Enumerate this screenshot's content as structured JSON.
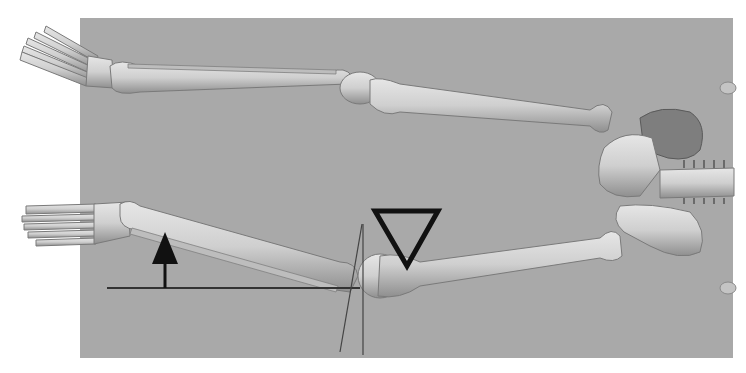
{
  "figure": {
    "background_color": "#a9a9a9",
    "bone_color": "#d2d2d2",
    "annotation_color": "#111111",
    "annotations": {
      "arrow": {
        "direction": "up",
        "x": 165,
        "tip_y": 232,
        "base_y": 288
      },
      "triangle": {
        "orientation": "down",
        "points": [
          [
            373,
            210
          ],
          [
            440,
            210
          ],
          [
            407,
            268
          ]
        ]
      },
      "horizontal_line": {
        "x1": 107,
        "x2": 360,
        "y": 288
      },
      "vertical_line": {
        "x": 363,
        "y1": 224,
        "y2": 355
      },
      "tilted_line": {
        "x1": 340,
        "y1": 352,
        "x2": 362,
        "y2": 224
      }
    }
  }
}
